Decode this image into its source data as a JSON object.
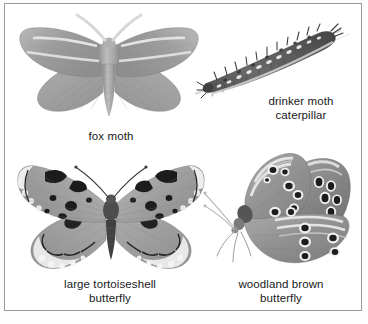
{
  "plate": {
    "background_color": "#ffffff",
    "frame_color": "#9a9a9a",
    "text_color": "#18181a",
    "style": "grayscale natural history illustration plate"
  },
  "figures": [
    {
      "id": "fox-moth",
      "caption": "fox moth",
      "subject": "moth",
      "view": "wings spread, dorsal",
      "icon_name": "fox-moth-illustration",
      "features": [
        "feathered antennae",
        "two pale cross-bands on forewings",
        "furry thorax and abdomen"
      ]
    },
    {
      "id": "drinker-moth-caterpillar",
      "caption": "drinker moth\ncaterpillar",
      "subject": "caterpillar",
      "view": "side, diagonal on grass blade",
      "icon_name": "drinker-moth-caterpillar-illustration",
      "features": [
        "dense dark hairs",
        "white lateral dashes",
        "resting on a grass stem"
      ]
    },
    {
      "id": "large-tortoiseshell-butterfly",
      "caption": "large tortoiseshell\nbutterfly",
      "subject": "butterfly",
      "view": "wings spread, dorsal",
      "icon_name": "large-tortoiseshell-butterfly-illustration",
      "features": [
        "dark blotches on forewings",
        "pale scalloped wing margins",
        "dark lunules along hindwing edge"
      ]
    },
    {
      "id": "woodland-brown-butterfly",
      "caption": "woodland brown\nbutterfly",
      "subject": "butterfly",
      "view": "wings closed, side",
      "icon_name": "woodland-brown-butterfly-illustration",
      "features": [
        "rows of ringed eyespots",
        "pale wavy bands",
        "slender clubbed antennae"
      ]
    }
  ]
}
